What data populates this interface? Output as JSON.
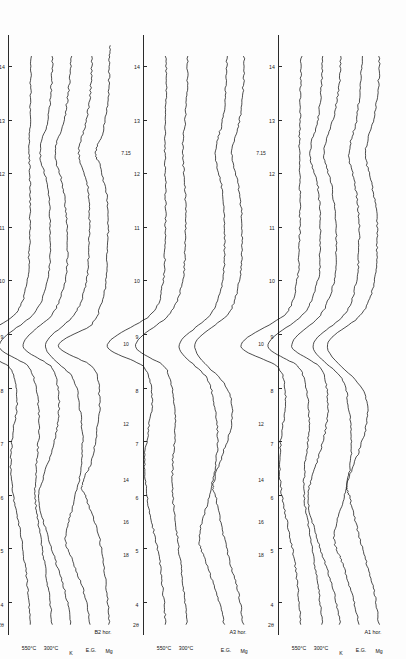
{
  "figure": {
    "panel_count": 3,
    "xaxis": {
      "caption": "2θ",
      "unit": "degrees",
      "ticks": [
        4,
        5,
        6,
        7,
        8,
        9,
        10,
        11,
        12,
        13,
        14
      ],
      "tick_labels": [
        "4",
        "5",
        "6",
        "7",
        "8",
        "9",
        "10",
        "11",
        "12",
        "13",
        "14"
      ],
      "range": [
        3.4,
        14.6
      ]
    },
    "dspacing_labels": [
      "18",
      "16",
      "14",
      "12",
      "10",
      "7.15"
    ],
    "dspacing_unit": "Å",
    "trace_labels": [
      "Mg",
      "E.G.",
      "K",
      "300°C",
      "550°C"
    ]
  },
  "panels": [
    {
      "id": "panel-b2",
      "title": "B2 hor.",
      "dlabels": [
        "18",
        "16",
        "14",
        "12",
        "10",
        "7.15"
      ],
      "traces": [
        {
          "label": "Mg"
        },
        {
          "label": "E.G."
        },
        {
          "label": "K"
        },
        {
          "label": "300°C"
        },
        {
          "label": "550°C"
        }
      ]
    },
    {
      "id": "panel-a3",
      "title": "A3 hor.",
      "dlabels": [
        "18",
        "16",
        "14",
        "12",
        "10",
        "7.15"
      ],
      "traces": [
        {
          "label": "Mg"
        },
        {
          "label": "E.G."
        },
        {
          "label": "300°C"
        },
        {
          "label": "550°C"
        }
      ]
    },
    {
      "id": "panel-a1",
      "title": "A1 hor.",
      "dlabels": [
        "18",
        "16",
        "14",
        "12",
        "10",
        "7.15"
      ],
      "traces": [
        {
          "label": "Mg"
        },
        {
          "label": "E.G."
        },
        {
          "label": "K"
        },
        {
          "label": "300°C"
        },
        {
          "label": "550°C"
        }
      ]
    }
  ],
  "chart_data": {
    "type": "line",
    "xlabel": "2θ",
    "ylabel": "Intensity (arbitrary units)",
    "xlim": [
      3.4,
      14.6
    ],
    "grid": false,
    "legend": "inline-trace-labels",
    "orientation": "rotated-90",
    "axis_ticks": [
      4,
      5,
      6,
      7,
      8,
      9,
      10,
      11,
      12,
      13,
      14
    ],
    "dspacing_markers_angstrom": [
      18,
      16,
      14,
      12,
      10,
      7.15
    ],
    "panels": [
      {
        "name": "B2 hor.",
        "series": [
          {
            "name": "Mg",
            "peaks_2theta": [
              6.2,
              8.8,
              12.4
            ],
            "peak_dspacing": [
              14.2,
              10.0,
              7.15
            ],
            "x": [
              3.6,
              4.2,
              4.8,
              5.4,
              6.0,
              6.2,
              6.6,
              7.2,
              7.8,
              8.4,
              8.8,
              9.2,
              9.8,
              10.4,
              11.0,
              11.6,
              12.2,
              12.4,
              12.8,
              13.4,
              14.0,
              14.4
            ],
            "y": [
              14,
              18,
              24,
              34,
              52,
              58,
              44,
              34,
              30,
              40,
              96,
              42,
              22,
              18,
              16,
              18,
              30,
              36,
              24,
              16,
              14,
              13
            ]
          },
          {
            "name": "E.G.",
            "peaks_2theta": [
              5.2,
              8.8,
              12.4
            ],
            "peak_dspacing": [
              17.0,
              10.0,
              7.15
            ],
            "x": [
              3.6,
              4.2,
              4.8,
              5.2,
              5.8,
              6.4,
              7.0,
              7.6,
              8.2,
              8.8,
              9.4,
              10.0,
              10.6,
              11.2,
              11.8,
              12.4,
              13.0,
              13.6,
              14.2
            ],
            "y": [
              16,
              26,
              44,
              56,
              44,
              32,
              28,
              32,
              44,
              88,
              40,
              22,
              18,
              17,
              20,
              34,
              22,
              15,
              13
            ]
          },
          {
            "name": "K",
            "peaks_2theta": [
              6.0,
              8.8,
              12.4
            ],
            "peak_dspacing": [
              14.7,
              10.0,
              7.15
            ],
            "x": [
              3.6,
              4.2,
              4.8,
              5.4,
              6.0,
              6.6,
              7.2,
              7.8,
              8.4,
              8.8,
              9.4,
              10.0,
              10.6,
              11.2,
              11.8,
              12.4,
              13.0,
              13.6,
              14.2
            ],
            "y": [
              15,
              24,
              40,
              56,
              66,
              52,
              38,
              34,
              46,
              92,
              44,
              24,
              20,
              22,
              28,
              40,
              26,
              18,
              14
            ]
          },
          {
            "name": "300°C",
            "peaks_2theta": [
              8.8,
              12.4
            ],
            "peak_dspacing": [
              10.0,
              7.15
            ],
            "x": [
              3.6,
              4.2,
              4.8,
              5.4,
              6.0,
              6.6,
              7.2,
              7.8,
              8.4,
              8.8,
              9.4,
              10.0,
              10.6,
              11.2,
              11.8,
              12.4,
              13.0,
              13.6,
              14.2
            ],
            "y": [
              13,
              18,
              26,
              34,
              40,
              38,
              34,
              36,
              50,
              98,
              42,
              20,
              16,
              16,
              20,
              32,
              20,
              14,
              12
            ]
          },
          {
            "name": "550°C",
            "peaks_2theta": [
              8.8
            ],
            "peak_dspacing": [
              10.0
            ],
            "x": [
              3.6,
              4.2,
              4.8,
              5.4,
              6.0,
              6.6,
              7.2,
              7.8,
              8.4,
              8.8,
              9.4,
              10.0,
              10.6,
              11.2,
              11.8,
              12.4,
              13.0,
              13.6,
              14.2
            ],
            "y": [
              12,
              16,
              22,
              30,
              40,
              44,
              40,
              34,
              46,
              104,
              36,
              18,
              14,
              13,
              13,
              14,
              13,
              12,
              11
            ]
          }
        ]
      },
      {
        "name": "A3 hor.",
        "series": [
          {
            "name": "Mg",
            "peaks_2theta": [
              6.2,
              8.8
            ],
            "peak_dspacing": [
              14.2,
              10.0
            ],
            "x": [
              3.6,
              4.2,
              4.8,
              5.4,
              6.0,
              6.2,
              6.8,
              7.4,
              8.0,
              8.8,
              9.4,
              10.0,
              10.6,
              11.2,
              11.8,
              12.4,
              13.0,
              13.6,
              14.2
            ],
            "y": [
              16,
              24,
              38,
              50,
              60,
              64,
              48,
              34,
              42,
              94,
              40,
              22,
              18,
              18,
              24,
              34,
              22,
              16,
              14
            ]
          },
          {
            "name": "E.G.",
            "peaks_2theta": [
              5.2,
              8.8
            ],
            "peak_dspacing": [
              17.0,
              10.0
            ],
            "x": [
              3.6,
              4.2,
              4.8,
              5.2,
              5.8,
              6.4,
              7.0,
              7.6,
              8.2,
              8.8,
              9.4,
              10.0,
              10.6,
              11.2,
              11.8,
              12.4,
              13.0,
              13.6,
              14.2
            ],
            "y": [
              18,
              30,
              48,
              58,
              46,
              34,
              28,
              32,
              46,
              90,
              38,
              20,
              17,
              17,
              22,
              32,
              20,
              15,
              13
            ]
          },
          {
            "name": "300°C",
            "peaks_2theta": [
              8.8
            ],
            "peak_dspacing": [
              10.0
            ],
            "x": [
              3.6,
              4.2,
              4.8,
              5.4,
              6.0,
              6.6,
              7.2,
              7.8,
              8.4,
              8.8,
              9.4,
              10.0,
              10.6,
              11.2,
              11.8,
              12.4,
              13.0,
              13.6,
              14.2
            ],
            "y": [
              13,
              18,
              24,
              30,
              36,
              36,
              32,
              34,
              48,
              96,
              40,
              20,
              16,
              15,
              16,
              20,
              16,
              13,
              12
            ]
          },
          {
            "name": "550°C",
            "peaks_2theta": [
              8.8
            ],
            "peak_dspacing": [
              10.0
            ],
            "x": [
              3.6,
              4.2,
              4.8,
              5.4,
              6.0,
              6.6,
              7.2,
              7.8,
              8.4,
              8.8,
              9.4,
              10.0,
              10.6,
              11.2,
              11.8,
              12.4,
              13.0,
              13.6,
              14.2
            ],
            "y": [
              12,
              16,
              22,
              32,
              42,
              46,
              40,
              34,
              46,
              106,
              34,
              16,
              13,
              12,
              12,
              13,
              12,
              11,
              11
            ]
          }
        ]
      },
      {
        "name": "A1 hor.",
        "series": [
          {
            "name": "Mg",
            "peaks_2theta": [
              6.2,
              8.8,
              12.4
            ],
            "peak_dspacing": [
              14.2,
              10.0,
              7.15
            ],
            "x": [
              3.6,
              4.2,
              4.8,
              5.4,
              6.0,
              6.2,
              6.8,
              7.4,
              8.0,
              8.8,
              9.4,
              10.0,
              10.6,
              11.2,
              11.8,
              12.4,
              13.0,
              13.6,
              14.2
            ],
            "y": [
              15,
              22,
              36,
              50,
              62,
              66,
              48,
              34,
              42,
              98,
              42,
              22,
              18,
              18,
              26,
              36,
              24,
              16,
              14
            ]
          },
          {
            "name": "E.G.",
            "peaks_2theta": [
              5.2,
              8.8,
              12.4
            ],
            "peak_dspacing": [
              17.0,
              10.0,
              7.15
            ],
            "x": [
              3.6,
              4.2,
              4.8,
              5.2,
              5.8,
              6.4,
              7.0,
              7.6,
              8.2,
              8.8,
              9.4,
              10.0,
              10.6,
              11.2,
              11.8,
              12.4,
              13.0,
              13.6,
              14.2
            ],
            "y": [
              18,
              30,
              46,
              58,
              46,
              34,
              30,
              34,
              46,
              92,
              40,
              22,
              18,
              18,
              24,
              34,
              22,
              16,
              13
            ]
          },
          {
            "name": "K",
            "peaks_2theta": [
              6.0,
              8.8,
              12.4
            ],
            "peak_dspacing": [
              14.7,
              10.0,
              7.15
            ],
            "x": [
              3.6,
              4.2,
              4.8,
              5.4,
              6.0,
              6.6,
              7.2,
              7.8,
              8.4,
              8.8,
              9.4,
              10.0,
              10.6,
              11.2,
              11.8,
              12.4,
              13.0,
              13.6,
              14.2
            ],
            "y": [
              16,
              26,
              42,
              58,
              68,
              54,
              40,
              36,
              48,
              94,
              46,
              26,
              22,
              24,
              30,
              42,
              28,
              18,
              15
            ]
          },
          {
            "name": "300°C",
            "peaks_2theta": [
              8.8,
              12.4
            ],
            "peak_dspacing": [
              10.0,
              7.15
            ],
            "x": [
              3.6,
              4.2,
              4.8,
              5.4,
              6.0,
              6.6,
              7.2,
              7.8,
              8.4,
              8.8,
              9.4,
              10.0,
              10.6,
              11.2,
              11.8,
              12.4,
              13.0,
              13.6,
              14.2
            ],
            "y": [
              13,
              18,
              26,
              34,
              42,
              40,
              34,
              36,
              50,
              100,
              42,
              20,
              16,
              16,
              20,
              32,
              20,
              14,
              12
            ]
          },
          {
            "name": "550°C",
            "peaks_2theta": [
              8.8
            ],
            "peak_dspacing": [
              10.0
            ],
            "x": [
              3.6,
              4.2,
              4.8,
              5.4,
              6.0,
              6.6,
              7.2,
              7.8,
              8.4,
              8.8,
              9.4,
              10.0,
              10.6,
              11.2,
              11.8,
              12.4,
              13.0,
              13.6,
              14.2
            ],
            "y": [
              12,
              16,
              22,
              32,
              42,
              46,
              42,
              36,
              48,
              108,
              36,
              18,
              14,
              13,
              13,
              14,
              13,
              12,
              11
            ]
          }
        ]
      }
    ]
  }
}
